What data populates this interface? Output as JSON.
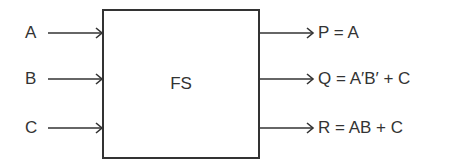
{
  "diagram": {
    "block": {
      "label": "FS"
    },
    "inputs": [
      {
        "label": "A"
      },
      {
        "label": "B"
      },
      {
        "label": "C"
      }
    ],
    "outputs": [
      {
        "label": "P = A"
      },
      {
        "label": "Q = A′B′ + C"
      },
      {
        "label": "R = AB + C"
      }
    ],
    "colors": {
      "stroke": "#333333",
      "background": "#ffffff"
    }
  }
}
